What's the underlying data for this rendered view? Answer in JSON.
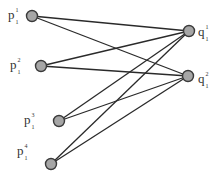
{
  "diagram": {
    "type": "bipartite-graph",
    "left_nodes": [
      {
        "id": "p1",
        "base": "p",
        "sup": "1",
        "sub": "1",
        "x": 32,
        "y": 16,
        "label_x": 8,
        "label_y": 8
      },
      {
        "id": "p2",
        "base": "p",
        "sup": "2",
        "sub": "1",
        "x": 41,
        "y": 66,
        "label_x": 10,
        "label_y": 58
      },
      {
        "id": "p3",
        "base": "p",
        "sup": "3",
        "sub": "1",
        "x": 59,
        "y": 121,
        "label_x": 24,
        "label_y": 113
      },
      {
        "id": "p4",
        "base": "p",
        "sup": "4",
        "sub": "1",
        "x": 51,
        "y": 164,
        "label_x": 17,
        "label_y": 144
      }
    ],
    "right_nodes": [
      {
        "id": "q1",
        "base": "q",
        "sup": "1",
        "sub": "1",
        "x": 189,
        "y": 31,
        "label_x": 198,
        "label_y": 25
      },
      {
        "id": "q2",
        "base": "q",
        "sup": "2",
        "sub": "1",
        "x": 188,
        "y": 76,
        "label_x": 198,
        "label_y": 72
      }
    ],
    "edges": [
      [
        "p1",
        "q1"
      ],
      [
        "p1",
        "q2"
      ],
      [
        "p2",
        "q1"
      ],
      [
        "p2",
        "q2"
      ],
      [
        "p3",
        "q1"
      ],
      [
        "p3",
        "q2"
      ],
      [
        "p4",
        "q1"
      ],
      [
        "p4",
        "q2"
      ]
    ],
    "colors": {
      "node_fill": "#a6a6a6",
      "node_stroke": "#3a3a3a",
      "edge": "#2a2a2a",
      "label": "#333333"
    }
  }
}
